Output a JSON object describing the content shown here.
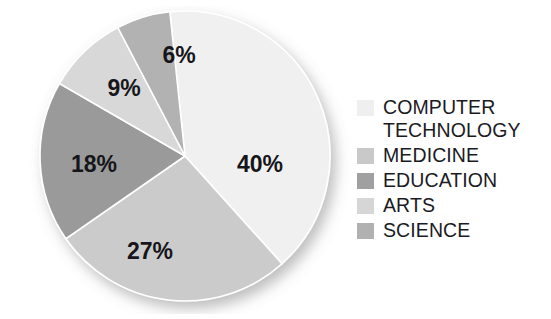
{
  "chart_data": {
    "type": "pie",
    "title": "",
    "categories": [
      "COMPUTER TECHNOLOGY",
      "MEDICINE",
      "EDUCATION",
      "ARTS",
      "SCIENCE"
    ],
    "values": [
      40,
      27,
      18,
      9,
      6
    ],
    "value_labels": [
      "40%",
      "27%",
      "18%",
      "9%",
      "6%"
    ],
    "units": "percent",
    "total": 100,
    "start_angle_deg": -6,
    "direction": "clockwise",
    "legend_position": "right",
    "grid": false,
    "colors": [
      "#f0f0f0",
      "#cbcbcb",
      "#9a9a9a",
      "#d8d8d8",
      "#b2b2b2"
    ],
    "slice_label_color": "#16161a",
    "outline_color": "#ffffff",
    "background": "#ffffff",
    "has_drop_shadow": true
  },
  "pie": {
    "slices": [
      {
        "name": "COMPUTER TECHNOLOGY",
        "label": "40%",
        "value": 40,
        "color": "#f0f0f0",
        "label_x": 238,
        "label_y": 160,
        "font_size": 23
      },
      {
        "name": "MEDICINE",
        "label": "27%",
        "value": 27,
        "color": "#cbcbcb",
        "label_x": 128,
        "label_y": 247,
        "font_size": 23
      },
      {
        "name": "EDUCATION",
        "label": "18%",
        "value": 18,
        "color": "#9a9a9a",
        "label_x": 72,
        "label_y": 160,
        "font_size": 23
      },
      {
        "name": "ARTS",
        "label": "9%",
        "value": 9,
        "color": "#d8d8d8",
        "label_x": 102,
        "label_y": 84,
        "font_size": 23
      },
      {
        "name": "SCIENCE",
        "label": "6%",
        "value": 6,
        "color": "#b2b2b2",
        "label_x": 157,
        "label_y": 51,
        "font_size": 23
      }
    ]
  },
  "legend": {
    "items": [
      {
        "label": "COMPUTER\nTECHNOLOGY",
        "color": "#efefef"
      },
      {
        "label": "MEDICINE",
        "color": "#c9c9c9"
      },
      {
        "label": "EDUCATION",
        "color": "#a0a0a0"
      },
      {
        "label": "ARTS",
        "color": "#d6d6d6"
      },
      {
        "label": "SCIENCE",
        "color": "#b1b1b1"
      }
    ]
  }
}
